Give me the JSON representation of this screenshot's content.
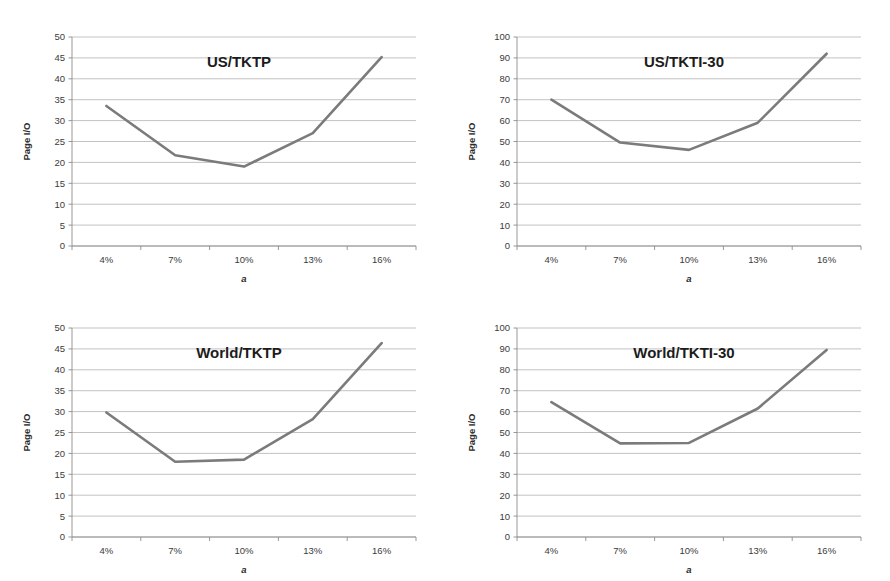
{
  "page": {
    "background_color": "#ffffff",
    "width": 890,
    "height": 581,
    "layout": "2x2 grid of line charts"
  },
  "style": {
    "line_color": "#7b7b7b",
    "gridline_color": "#a9a9a9",
    "axis_color": "#8c8c8c",
    "text_color": "#231f20"
  },
  "charts": [
    {
      "id": "us-tktp",
      "title": "US/TKTP",
      "xlabel": "a",
      "ylabel": "Page I/O",
      "categories": [
        "4%",
        "7%",
        "10%",
        "13%",
        "16%"
      ],
      "values": [
        33.5,
        21.7,
        19.0,
        27.0,
        45.2
      ],
      "ylim": [
        0,
        50
      ],
      "yticks": [
        "0",
        "5",
        "10",
        "15",
        "20",
        "25",
        "30",
        "35",
        "40",
        "45",
        "50"
      ],
      "ytick_values": [
        0,
        5,
        10,
        15,
        20,
        25,
        30,
        35,
        40,
        45,
        50
      ]
    },
    {
      "id": "us-tkti-30",
      "title": "US/TKTI-30",
      "xlabel": "a",
      "ylabel": "Page I/O",
      "categories": [
        "4%",
        "7%",
        "10%",
        "13%",
        "16%"
      ],
      "values": [
        70.0,
        49.5,
        46.0,
        59.0,
        92.0
      ],
      "ylim": [
        0,
        100
      ],
      "yticks": [
        "0",
        "10",
        "20",
        "30",
        "40",
        "50",
        "60",
        "70",
        "80",
        "90",
        "100"
      ],
      "ytick_values": [
        0,
        10,
        20,
        30,
        40,
        50,
        60,
        70,
        80,
        90,
        100
      ]
    },
    {
      "id": "world-tktp",
      "title": "World/TKTP",
      "xlabel": "a",
      "ylabel": "Page I/O",
      "categories": [
        "4%",
        "7%",
        "10%",
        "13%",
        "16%"
      ],
      "values": [
        29.8,
        18.0,
        18.5,
        28.2,
        46.4
      ],
      "ylim": [
        0,
        50
      ],
      "yticks": [
        "0",
        "5",
        "10",
        "15",
        "20",
        "25",
        "30",
        "35",
        "40",
        "45",
        "50"
      ],
      "ytick_values": [
        0,
        5,
        10,
        15,
        20,
        25,
        30,
        35,
        40,
        45,
        50
      ]
    },
    {
      "id": "world-tkti-30",
      "title": "World/TKTI-30",
      "xlabel": "a",
      "ylabel": "Page I/O",
      "categories": [
        "4%",
        "7%",
        "10%",
        "13%",
        "16%"
      ],
      "values": [
        64.5,
        44.8,
        45.0,
        61.5,
        89.5
      ],
      "ylim": [
        0,
        100
      ],
      "yticks": [
        "0",
        "10",
        "20",
        "30",
        "40",
        "50",
        "60",
        "70",
        "80",
        "90",
        "100"
      ],
      "ytick_values": [
        0,
        10,
        20,
        30,
        40,
        50,
        60,
        70,
        80,
        90,
        100
      ]
    }
  ],
  "chart_data": [
    {
      "type": "line",
      "title": "US/TKTP",
      "xlabel": "a",
      "ylabel": "Page I/O",
      "categories": [
        "4%",
        "7%",
        "10%",
        "13%",
        "16%"
      ],
      "values": [
        33.5,
        21.7,
        19.0,
        27.0,
        45.2
      ],
      "ylim": [
        0,
        50
      ],
      "ytick_step": 5,
      "grid": "horizontal",
      "legend": "none"
    },
    {
      "type": "line",
      "title": "US/TKTI-30",
      "xlabel": "a",
      "ylabel": "Page I/O",
      "categories": [
        "4%",
        "7%",
        "10%",
        "13%",
        "16%"
      ],
      "values": [
        70.0,
        49.5,
        46.0,
        59.0,
        92.0
      ],
      "ylim": [
        0,
        100
      ],
      "ytick_step": 10,
      "grid": "horizontal",
      "legend": "none"
    },
    {
      "type": "line",
      "title": "World/TKTP",
      "xlabel": "a",
      "ylabel": "Page I/O",
      "categories": [
        "4%",
        "7%",
        "10%",
        "13%",
        "16%"
      ],
      "values": [
        29.8,
        18.0,
        18.5,
        28.2,
        46.4
      ],
      "ylim": [
        0,
        50
      ],
      "ytick_step": 5,
      "grid": "horizontal",
      "legend": "none"
    },
    {
      "type": "line",
      "title": "World/TKTI-30",
      "xlabel": "a",
      "ylabel": "Page I/O",
      "categories": [
        "4%",
        "7%",
        "10%",
        "13%",
        "16%"
      ],
      "values": [
        64.5,
        44.8,
        45.0,
        61.5,
        89.5
      ],
      "ylim": [
        0,
        100
      ],
      "ytick_step": 10,
      "grid": "horizontal",
      "legend": "none"
    }
  ]
}
